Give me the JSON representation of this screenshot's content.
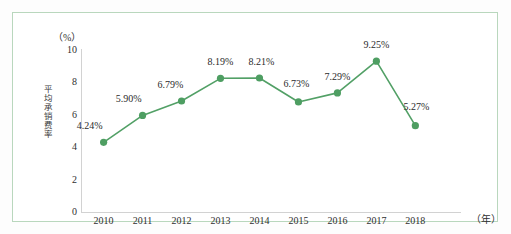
{
  "chart_data": {
    "type": "line",
    "title": "",
    "subtitle": "",
    "xlabel": "（年）",
    "ylabel": "平均承销费率",
    "yunit": "（%）",
    "categories": [
      "2010",
      "2011",
      "2012",
      "2013",
      "2014",
      "2015",
      "2016",
      "2017",
      "2018"
    ],
    "values": [
      4.24,
      5.9,
      6.79,
      8.19,
      8.21,
      6.73,
      7.29,
      9.25,
      5.27
    ],
    "point_labels": [
      "4.24%",
      "5.90%",
      "6.79%",
      "8.19%",
      "8.21%",
      "6.73%",
      "7.29%",
      "9.25%",
      "5.27%"
    ],
    "ylim": [
      0,
      10
    ],
    "yticks": [
      "0",
      "2",
      "4",
      "6",
      "8",
      "10"
    ],
    "ytick_values": [
      0,
      2,
      4,
      6,
      8,
      10
    ],
    "grid": false,
    "legend": "none",
    "series": [
      {
        "name": "平均承销费率",
        "values": [
          4.24,
          5.9,
          6.79,
          8.19,
          8.21,
          6.73,
          7.29,
          9.25,
          5.27
        ],
        "color": "#52a066",
        "marker": "circle"
      }
    ],
    "label_offsets": [
      {
        "dx": -14,
        "dy": -17
      },
      {
        "dx": -14,
        "dy": -17
      },
      {
        "dx": -11,
        "dy": -17
      },
      {
        "dx": 0,
        "dy": -17
      },
      {
        "dx": 2,
        "dy": -17
      },
      {
        "dx": -2,
        "dy": -19
      },
      {
        "dx": 0,
        "dy": -17
      },
      {
        "dx": 0,
        "dy": -17
      },
      {
        "dx": 1,
        "dy": -20
      }
    ]
  },
  "colors": {
    "line": "#52a066",
    "marker": "#4e9e62",
    "border": "#b9d7bd",
    "axis": "#d2d2d2",
    "text": "#2b2b2b",
    "background": "#ffffff"
  }
}
